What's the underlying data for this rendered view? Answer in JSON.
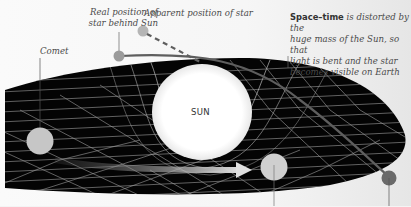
{
  "labels": {
    "real_position": "Real position of star behind Sun",
    "real_position_line1": "Real position of",
    "real_position_line2": "star behind Sun",
    "apparent_position": "Apparent position of star",
    "comet": "Comet",
    "space_time_bold": "Space–time",
    "space_time_rest_line1": " is distorted by the",
    "space_time_line2": "huge mass of the Sun, so that",
    "space_time_line3": "light is bent and the star",
    "space_time_line4": "becomes visible on Earth",
    "sun": "SUN"
  },
  "elements": {
    "sun": {
      "name": "Sun",
      "color": "#ffffff"
    },
    "comet": {
      "name": "Comet",
      "color": "#c8c8c8"
    },
    "planet": {
      "name": "Orbiting body",
      "color": "#cfcfcf"
    },
    "earth": {
      "name": "Earth",
      "color": "#6a6a6a"
    },
    "real_star": {
      "name": "Real star",
      "color": "#9a9a9a"
    },
    "apparent_star": {
      "name": "Apparent star",
      "color": "#b8b8b8"
    },
    "space_time_grid": {
      "color": "#000000",
      "line_color": "#bdbdbd"
    },
    "light_path": {
      "color": "#6a6a6a"
    },
    "apparent_path": {
      "color": "#6a6a6a",
      "style": "dashed"
    },
    "orbit_arrow": {
      "color": "#d9d9d9"
    }
  }
}
